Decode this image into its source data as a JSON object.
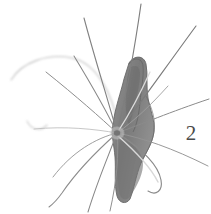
{
  "plate": {
    "width": 211,
    "height": 214,
    "background_color": "#ffffff",
    "paper_color": "#fefefe",
    "medium": "halftone grayscale photographic plate"
  },
  "figure": {
    "number_label": "2",
    "number_color": "#4a4a4a",
    "number_position": {
      "x": 188,
      "y": 133
    },
    "body": {
      "fill_dark": "#6f6f6f",
      "fill_mid": "#8a8a8a",
      "fill_light": "#a9a9a9",
      "outline_color": "#5c5c5c",
      "center_of_setae": {
        "x": 117,
        "y": 133
      },
      "head_lobe": {
        "x": 136,
        "y": 62
      },
      "tail_tip": {
        "x": 130,
        "y": 201
      }
    },
    "setae": {
      "count": 14,
      "stroke_color": "#7d7d7d",
      "faint_stroke_color": "#c9c9c9",
      "description": "long slender bristles radiating from a central node, several curving"
    }
  }
}
